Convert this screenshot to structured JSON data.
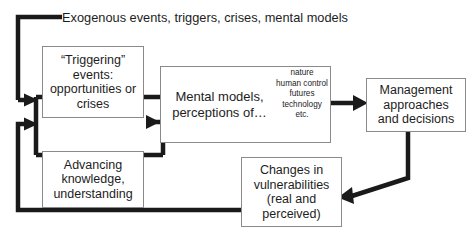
{
  "diagram": {
    "title_label": "Exogenous events, triggers, crises, mental models",
    "nodes": {
      "triggering": {
        "id": "triggering-events",
        "text": "“Triggering”\nevents:\nopportunities or\ncrises"
      },
      "advancing": {
        "id": "advancing-knowledge",
        "text": "Advancing\nknowledge,\nunderstanding"
      },
      "mental_models": {
        "id": "mental-models",
        "text": "Mental models,\nperceptions of…",
        "aspects": "nature\nhuman control\nfutures\ntechnology\netc."
      },
      "management": {
        "id": "management-approaches",
        "text": "Management\napproaches\nand decisions"
      },
      "changes": {
        "id": "changes-in-vulnerabilities",
        "text": "Changes in\nvulnerabilities\n(real and\nperceived)"
      }
    },
    "colors": {
      "connector": "#1a1a1a",
      "box_border": "#8a8a8a",
      "text": "#1d1d1d",
      "background": "#ffffff"
    }
  }
}
